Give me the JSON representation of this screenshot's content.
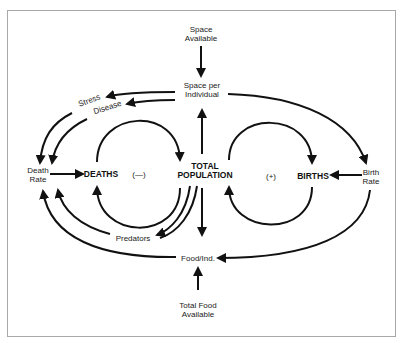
{
  "diagram": {
    "type": "causal-loop",
    "nodes": {
      "space_available": "Space\nAvailable",
      "space_per_individual": "Space per\nIndividual",
      "stress": "Stress",
      "disease": "Disease",
      "death_rate": "Death\nRate",
      "deaths": "DEATHS",
      "negative_loop": "(—)",
      "total_population": "TOTAL\nPOPULATION",
      "positive_loop": "(+)",
      "births": "BIRTHS",
      "birth_rate": "Birth\nRate",
      "predators": "Predators",
      "food_per_ind": "Food/Ind.",
      "total_food": "Total Food\nAvailable"
    },
    "edges": [
      {
        "from": "Space Available",
        "to": "Space per Individual"
      },
      {
        "from": "Space per Individual",
        "to": "Death Rate",
        "via": "Stress"
      },
      {
        "from": "Space per Individual",
        "to": "Death Rate",
        "via": "Disease"
      },
      {
        "from": "Space per Individual",
        "to": "Birth Rate"
      },
      {
        "from": "Death Rate",
        "to": "DEATHS"
      },
      {
        "from": "DEATHS",
        "to": "TOTAL POPULATION"
      },
      {
        "from": "TOTAL POPULATION",
        "to": "DEATHS"
      },
      {
        "from": "TOTAL POPULATION",
        "to": "Space per Individual"
      },
      {
        "from": "TOTAL POPULATION",
        "to": "Food/Ind."
      },
      {
        "from": "TOTAL POPULATION",
        "to": "BIRTHS"
      },
      {
        "from": "BIRTHS",
        "to": "TOTAL POPULATION"
      },
      {
        "from": "Birth Rate",
        "to": "BIRTHS"
      },
      {
        "from": "TOTAL POPULATION",
        "to": "Death Rate",
        "via": "Predators"
      },
      {
        "from": "Food/Ind.",
        "to": "Death Rate"
      },
      {
        "from": "Birth Rate",
        "to": "Food/Ind."
      },
      {
        "from": "Total Food Available",
        "to": "Food/Ind."
      }
    ]
  }
}
